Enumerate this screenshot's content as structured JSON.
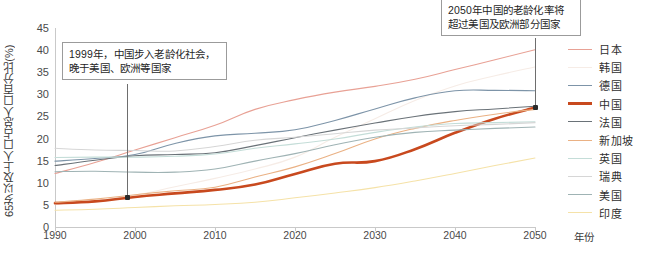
{
  "top_clipped_text": "",
  "axes": {
    "y_title": "65岁以及上人口占总人口百分比(%)",
    "x_title": "年份",
    "y_ticks": [
      "0",
      "5",
      "10",
      "15",
      "20",
      "25",
      "30",
      "35",
      "40",
      "45"
    ],
    "x_ticks": [
      "1990",
      "2000",
      "2010",
      "2020",
      "2030",
      "2040",
      "2050"
    ]
  },
  "annotations": [
    {
      "id": "anno-1999",
      "text": "1999年，中国步入老龄化社会，\n晚于美国、欧洲等国家"
    },
    {
      "id": "anno-2050",
      "text": "2050年中国的老龄化率将\n超过美国及欧洲部分国家"
    }
  ],
  "legend": {
    "items": [
      {
        "label": "日本",
        "color": "#e8a195"
      },
      {
        "label": "韩国",
        "color": "#f6ece6"
      },
      {
        "label": "德国",
        "color": "#7d94a8"
      },
      {
        "label": "中国",
        "color": "#c8491e"
      },
      {
        "label": "法国",
        "color": "#6a7278"
      },
      {
        "label": "新加坡",
        "color": "#eab184"
      },
      {
        "label": "英国",
        "color": "#c4ddd8"
      },
      {
        "label": "瑞典",
        "color": "#d6d6d6"
      },
      {
        "label": "美国",
        "color": "#9fb3b4"
      },
      {
        "label": "印度",
        "color": "#f5e2a8"
      }
    ]
  },
  "chart_data": {
    "type": "line",
    "title": "",
    "xlabel": "年份",
    "ylabel": "65岁以及上人口占总人口百分比(%)",
    "xlim": [
      1990,
      2050
    ],
    "ylim": [
      0,
      45
    ],
    "grid": false,
    "legend_position": "right",
    "x": [
      1990,
      1995,
      2000,
      2005,
      2010,
      2015,
      2020,
      2025,
      2030,
      2035,
      2040,
      2045,
      2050
    ],
    "series": [
      {
        "name": "日本",
        "color": "#e8a195",
        "values": [
          12.1,
          14.6,
          17.4,
          20.2,
          23.0,
          26.6,
          28.8,
          30.5,
          31.8,
          33.4,
          35.6,
          37.8,
          40.1
        ]
      },
      {
        "name": "韩国",
        "color": "#f6ece6",
        "values": [
          5.1,
          5.9,
          7.2,
          9.1,
          11.0,
          13.1,
          15.8,
          20.3,
          24.5,
          28.6,
          31.9,
          34.2,
          36.2
        ]
      },
      {
        "name": "德国",
        "color": "#7d94a8",
        "values": [
          14.9,
          15.5,
          16.4,
          18.9,
          20.6,
          21.2,
          22.0,
          24.1,
          26.7,
          29.2,
          30.8,
          30.9,
          30.8
        ]
      },
      {
        "name": "中国",
        "color": "#c8491e",
        "values": [
          5.4,
          5.8,
          6.8,
          7.6,
          8.4,
          9.6,
          12.0,
          14.3,
          14.9,
          17.6,
          21.3,
          24.5,
          27.0
        ]
      },
      {
        "name": "法国",
        "color": "#6a7278",
        "values": [
          13.9,
          15.1,
          16.1,
          16.4,
          16.8,
          18.4,
          20.2,
          21.9,
          23.5,
          25.0,
          26.1,
          26.7,
          27.3
        ]
      },
      {
        "name": "新加坡",
        "color": "#eab184",
        "values": [
          5.6,
          6.3,
          7.3,
          8.2,
          9.0,
          11.3,
          13.6,
          16.6,
          19.9,
          22.3,
          24.1,
          25.5,
          26.6
        ]
      },
      {
        "name": "英国",
        "color": "#c4ddd8",
        "values": [
          15.7,
          15.8,
          15.8,
          16.0,
          16.5,
          17.8,
          18.8,
          19.9,
          21.4,
          22.6,
          23.4,
          23.6,
          23.8
        ]
      },
      {
        "name": "瑞典",
        "color": "#d6d6d6",
        "values": [
          17.8,
          17.4,
          17.3,
          17.2,
          18.2,
          19.6,
          20.3,
          21.1,
          21.9,
          22.4,
          22.9,
          23.2,
          23.6
        ]
      },
      {
        "name": "美国",
        "color": "#9fb3b4",
        "values": [
          12.5,
          12.6,
          12.4,
          12.4,
          13.1,
          14.9,
          16.6,
          18.6,
          20.3,
          21.4,
          21.9,
          22.3,
          22.6
        ]
      },
      {
        "name": "印度",
        "color": "#f5e2a8",
        "values": [
          3.8,
          4.0,
          4.4,
          4.8,
          5.1,
          5.6,
          6.6,
          7.7,
          8.9,
          10.4,
          12.1,
          13.9,
          15.6
        ]
      }
    ],
    "markers": [
      {
        "series": "中国",
        "x": 1999,
        "y": 6.6,
        "label": "1999"
      },
      {
        "series": "中国",
        "x": 2050,
        "y": 27.0,
        "label": "2050"
      }
    ]
  }
}
